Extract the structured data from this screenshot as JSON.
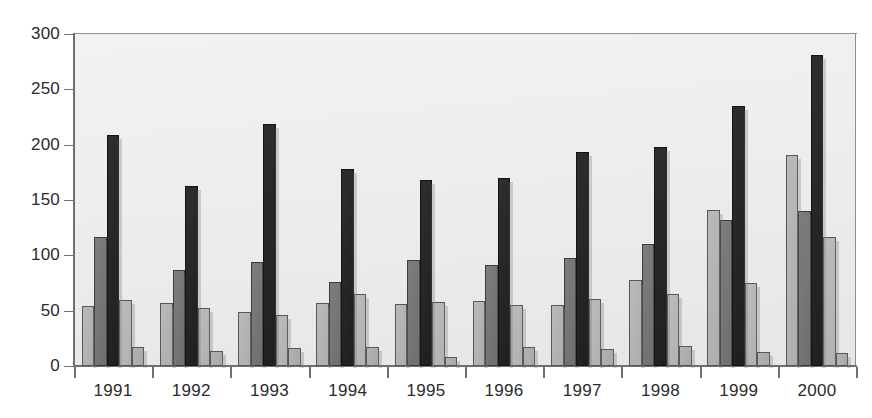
{
  "chart_data": {
    "type": "bar",
    "title": "",
    "subtitle": "",
    "xlabel": "",
    "ylabel": "",
    "categories": [
      "1991",
      "1992",
      "1993",
      "1994",
      "1995",
      "1996",
      "1997",
      "1998",
      "1999",
      "2000"
    ],
    "ylim": [
      0,
      300
    ],
    "y_ticks": [
      0,
      50,
      100,
      150,
      200,
      250,
      300
    ],
    "y_tick_labels": [
      "0",
      "50",
      "100",
      "150",
      "200",
      "250",
      "300"
    ],
    "grid": false,
    "legend": "none",
    "series": [
      {
        "name": "series-1",
        "color": "#b3b3b1",
        "values": [
          54,
          57,
          49,
          57,
          56,
          59,
          55,
          78,
          141,
          191
        ]
      },
      {
        "name": "series-2",
        "color": "#777777",
        "values": [
          117,
          87,
          94,
          76,
          96,
          91,
          98,
          110,
          132,
          140
        ]
      },
      {
        "name": "series-3",
        "color": "#242424",
        "values": [
          209,
          163,
          219,
          178,
          168,
          170,
          193,
          198,
          235,
          281
        ]
      },
      {
        "name": "series-4",
        "color": "#bcbcba",
        "values": [
          60,
          52,
          46,
          65,
          58,
          55,
          61,
          65,
          75,
          117
        ]
      },
      {
        "name": "series-5",
        "color": "#b3b3b1",
        "values": [
          17,
          14,
          16,
          17,
          8,
          17,
          15,
          18,
          13,
          12
        ]
      }
    ]
  },
  "plot": {
    "background_color": "#ececea",
    "axis_color": "#6f6f6f",
    "text_color": "#2b2b2b"
  }
}
